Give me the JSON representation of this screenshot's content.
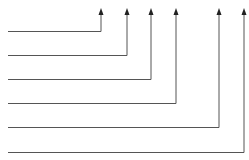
{
  "diagram": {
    "type": "leader-lines",
    "line_color": "#555555",
    "arrow_color": "#222222",
    "connectors": [
      {
        "id": 1,
        "label": ""
      },
      {
        "id": 2,
        "label": ""
      },
      {
        "id": 3,
        "label": ""
      },
      {
        "id": 4,
        "label": ""
      },
      {
        "id": 5,
        "label": ""
      },
      {
        "id": 6,
        "label": ""
      }
    ]
  }
}
